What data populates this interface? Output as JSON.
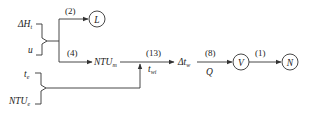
{
  "diagram": {
    "inputs_top": {
      "a": {
        "main": "ΔH",
        "sub": "t"
      },
      "b": {
        "main": "u",
        "sub": ""
      }
    },
    "inputs_bottom": {
      "a": {
        "main": "t",
        "sub": "e"
      },
      "b": {
        "main": "NTU",
        "sub": "e"
      }
    },
    "edges": {
      "e2": "(2)",
      "e4": "(4)",
      "e13": "(13)",
      "e8": "(8)",
      "e1": "(1)"
    },
    "nodes": {
      "L": "L",
      "ntum": {
        "main": "NTU",
        "sub": "m"
      },
      "twi": {
        "main": "t",
        "sub": "wi"
      },
      "dtw": {
        "main": "Δt",
        "sub": "w"
      },
      "Q": "Q",
      "V": "V",
      "N": "N"
    }
  }
}
